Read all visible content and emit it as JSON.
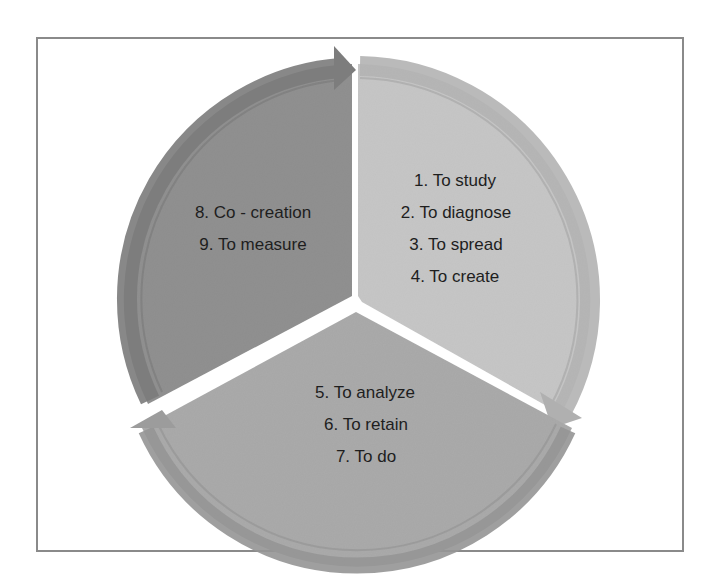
{
  "diagram": {
    "type": "cycle-pie",
    "segment_count": 3,
    "segments": [
      {
        "id": "right",
        "color": "#c4c4c4",
        "rim_color": "#b2b2b2",
        "lines": [
          "1. To study",
          "2. To diagnose",
          "3. To  spread",
          "4. To create"
        ]
      },
      {
        "id": "bottom",
        "color": "#a9a9a9",
        "rim_color": "#939393",
        "lines": [
          "5. To analyze",
          "6. To retain",
          "7. To do"
        ]
      },
      {
        "id": "left",
        "color": "#8f8f8f",
        "rim_color": "#7a7a7a",
        "lines": [
          "8. Co - creation",
          "9. To measure"
        ]
      }
    ],
    "frame_color": "#8a8a8a",
    "background": "#ffffff"
  }
}
